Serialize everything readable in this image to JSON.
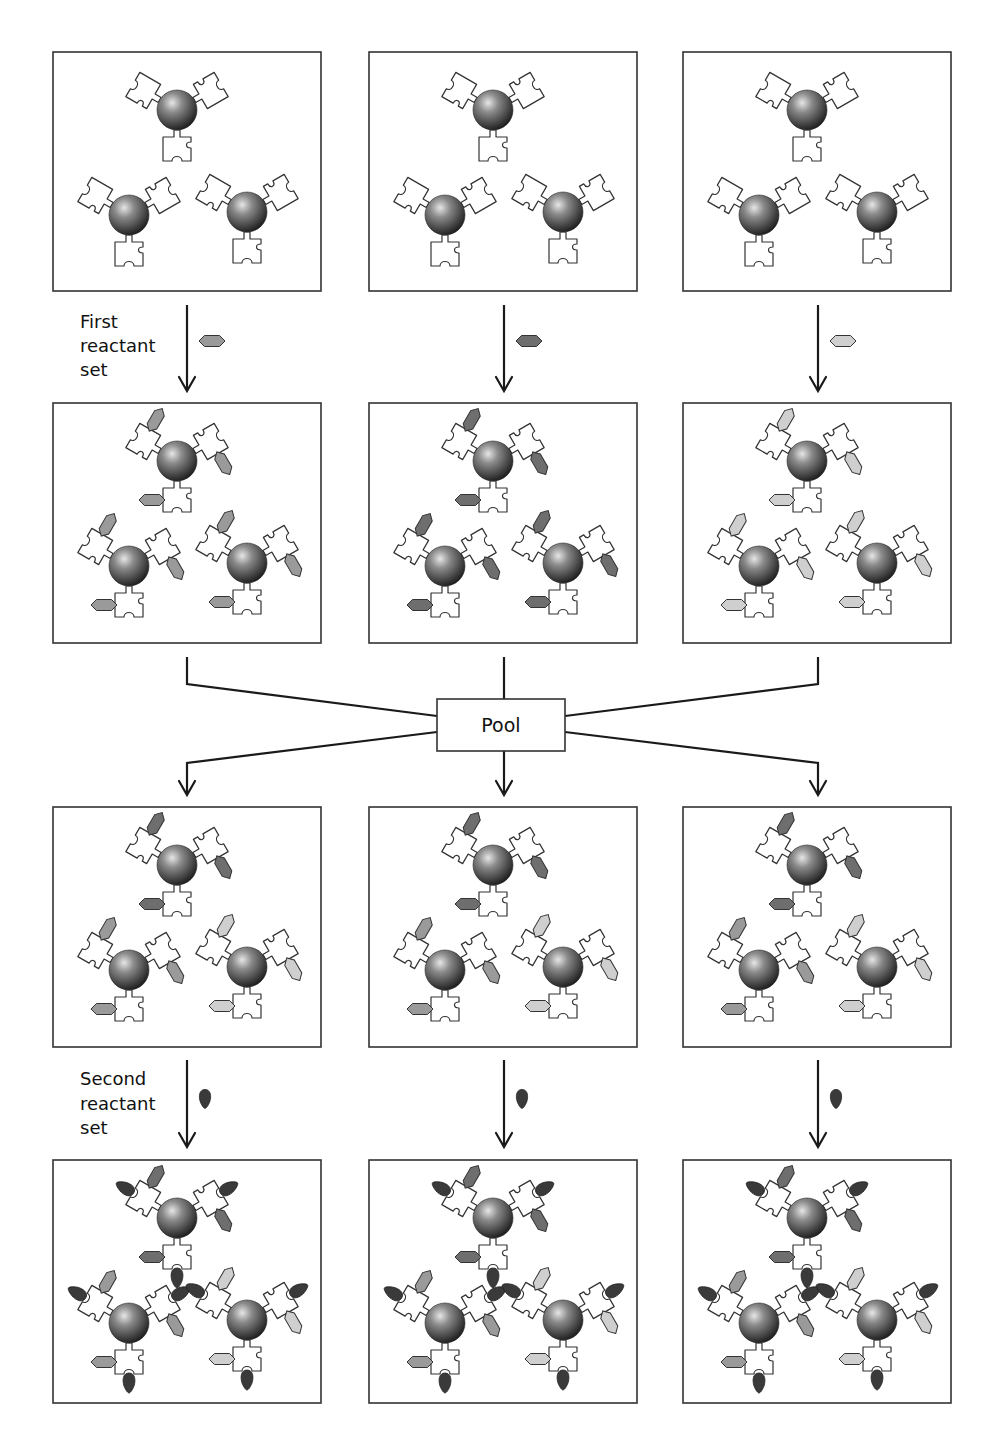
{
  "colors": {
    "dark": "#6e6e6e",
    "medium": "#9a9a9a",
    "light": "#cfcfcf",
    "reactant2": "#3a3a3a",
    "bead_highlight": "#e6e6e6",
    "bead_mid": "#8a8a8a",
    "bead_shadow": "#1f1f1f"
  },
  "layout": {
    "columns_x": [
      53,
      369,
      683
    ],
    "box_width": 268,
    "rows": [
      {
        "y": 52,
        "h": 239
      },
      {
        "y": 403,
        "h": 240
      },
      {
        "y": 807,
        "h": 240
      },
      {
        "y": 1160,
        "h": 243
      }
    ]
  },
  "labels": {
    "first_reactant_set": [
      "First",
      "reactant",
      "set"
    ],
    "second_reactant_set": [
      "Second",
      "reactant",
      "set"
    ],
    "pool": "Pool"
  },
  "steps": [
    {
      "name": "first-reactant-step",
      "reactant_shape": "hexagon",
      "reactants": [
        "medium",
        "dark",
        "light"
      ]
    },
    {
      "name": "second-reactant-step",
      "reactant_shape": "droplet",
      "reactants": [
        "reactant2",
        "reactant2",
        "reactant2"
      ]
    }
  ],
  "panels": [
    {
      "row": 0,
      "col": 0,
      "beads": [
        null,
        null,
        null
      ],
      "second": false
    },
    {
      "row": 0,
      "col": 1,
      "beads": [
        null,
        null,
        null
      ],
      "second": false
    },
    {
      "row": 0,
      "col": 2,
      "beads": [
        null,
        null,
        null
      ],
      "second": false
    },
    {
      "row": 1,
      "col": 0,
      "beads": [
        "medium",
        "medium",
        "medium"
      ],
      "second": false
    },
    {
      "row": 1,
      "col": 1,
      "beads": [
        "dark",
        "dark",
        "dark"
      ],
      "second": false
    },
    {
      "row": 1,
      "col": 2,
      "beads": [
        "light",
        "light",
        "light"
      ],
      "second": false
    },
    {
      "row": 2,
      "col": 0,
      "beads": [
        "dark",
        "medium",
        "light"
      ],
      "second": false
    },
    {
      "row": 2,
      "col": 1,
      "beads": [
        "dark",
        "medium",
        "light"
      ],
      "second": false
    },
    {
      "row": 2,
      "col": 2,
      "beads": [
        "dark",
        "medium",
        "light"
      ],
      "second": false
    },
    {
      "row": 3,
      "col": 0,
      "beads": [
        "dark",
        "medium",
        "light"
      ],
      "second": true
    },
    {
      "row": 3,
      "col": 1,
      "beads": [
        "dark",
        "medium",
        "light"
      ],
      "second": true
    },
    {
      "row": 3,
      "col": 2,
      "beads": [
        "dark",
        "medium",
        "light"
      ],
      "second": true
    }
  ],
  "bead_offsets": [
    {
      "dx": 124,
      "dy": 58
    },
    {
      "dx": 76,
      "dy": 163
    },
    {
      "dx": 194,
      "dy": 160
    }
  ]
}
